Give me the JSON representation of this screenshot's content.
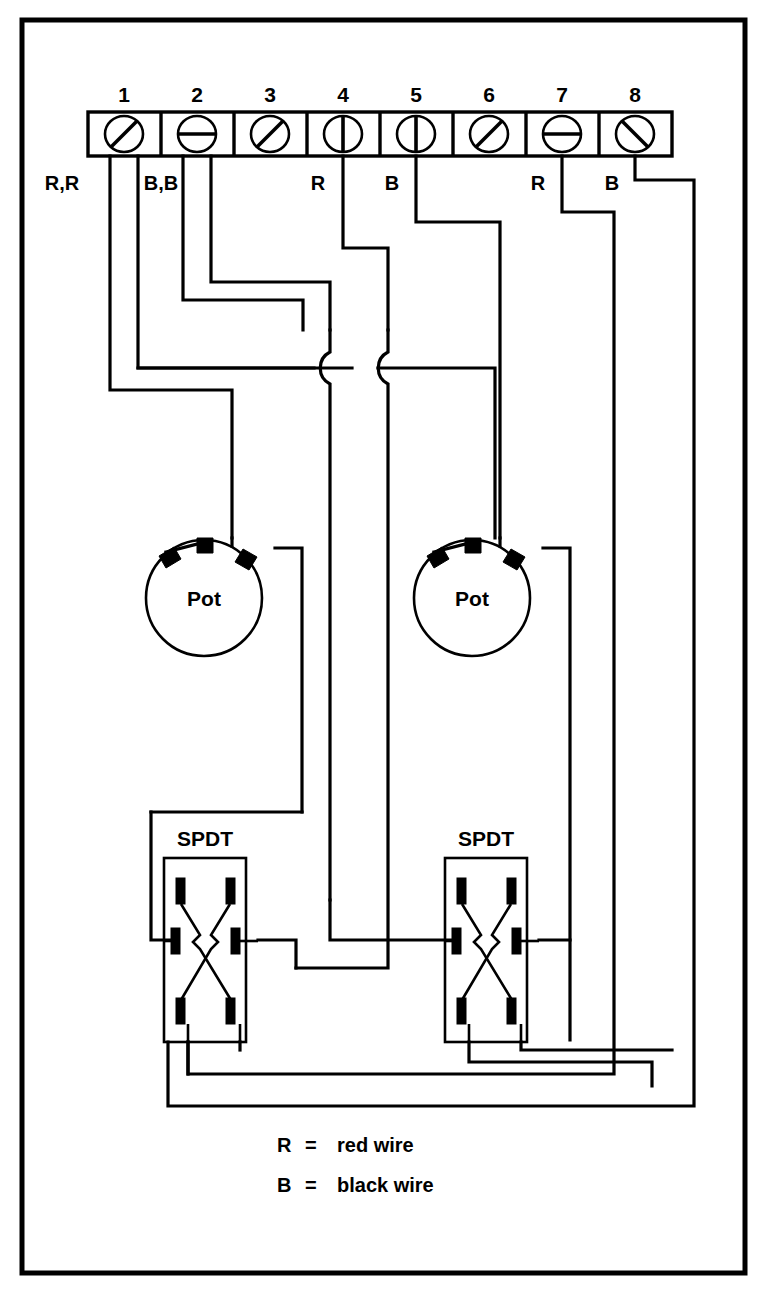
{
  "diagram": {
    "frame": {
      "color": "#000000"
    },
    "terminal_block": {
      "name": "8-position terminal block",
      "count": 8,
      "terminals": [
        {
          "number": "1",
          "slot": "diagonal-ne-sw",
          "wire_label": "R,R",
          "wire_count": 2
        },
        {
          "number": "2",
          "slot": "horizontal",
          "wire_label": "B,B",
          "wire_count": 2
        },
        {
          "number": "3",
          "slot": "diagonal-ne-sw",
          "wire_label": "",
          "wire_count": 0
        },
        {
          "number": "4",
          "slot": "vertical",
          "wire_label": "R",
          "wire_count": 1
        },
        {
          "number": "5",
          "slot": "vertical",
          "wire_label": "B",
          "wire_count": 1
        },
        {
          "number": "6",
          "slot": "diagonal-ne-sw",
          "wire_label": "",
          "wire_count": 0
        },
        {
          "number": "7",
          "slot": "horizontal",
          "wire_label": "R",
          "wire_count": 1
        },
        {
          "number": "8",
          "slot": "diagonal-nw-se",
          "wire_label": "B",
          "wire_count": 1
        }
      ]
    },
    "components": [
      {
        "id": "pot-left",
        "type": "potentiometer",
        "label": "Pot",
        "lugs": 3
      },
      {
        "id": "pot-right",
        "type": "potentiometer",
        "label": "Pot",
        "lugs": 3
      },
      {
        "id": "spdt-left",
        "type": "switch",
        "label": "SPDT",
        "lugs": 6
      },
      {
        "id": "spdt-right",
        "type": "switch",
        "label": "SPDT",
        "lugs": 6
      }
    ],
    "crossovers": {
      "name": "wire-hop",
      "count": 2
    },
    "legend": [
      {
        "symbol": "R",
        "equals": "=",
        "meaning": "red wire"
      },
      {
        "symbol": "B",
        "equals": "=",
        "meaning": "black wire"
      }
    ]
  }
}
